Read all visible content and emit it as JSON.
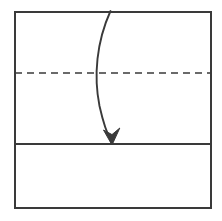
{
  "canvas": {
    "width": 222,
    "height": 221,
    "background": "#ffffff"
  },
  "diagram": {
    "type": "origami-fold-step",
    "stroke_color": "#3a3a3a",
    "dash_color": "#3a3a3a",
    "fill_color": "#ffffff",
    "stroke_width": 2,
    "dash_stroke_width": 1.6,
    "dash_pattern": "7 5"
  },
  "shapes": {
    "paper_sheet": {
      "name": "paper-sheet",
      "x": 15,
      "y": 12,
      "width": 196,
      "height": 196
    },
    "crease_line": {
      "name": "crease-line",
      "x1": 15,
      "y1": 73,
      "x2": 211,
      "y2": 73,
      "style": "dashed"
    },
    "fold_edge_line": {
      "name": "fold-edge-line",
      "x1": 14,
      "y1": 144,
      "x2": 212,
      "y2": 144,
      "style": "solid"
    },
    "fold_arrow": {
      "name": "fold-arrow",
      "path": "M 110.5 11 C 96 40, 94 76, 100 108 C 105 126, 109 136, 111.5 141",
      "arrowhead": "M 111.5 144.5 L 104.5 131.5 L 112.2 135.0 L 119.5 128.5 Z",
      "direction": "downward",
      "meaning": "fold top portion down along crease"
    }
  }
}
